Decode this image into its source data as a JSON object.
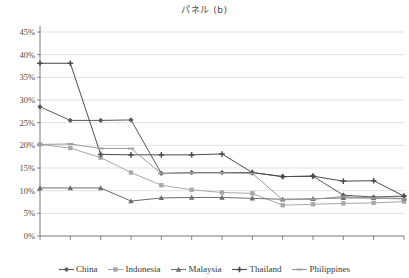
{
  "chart_data": {
    "type": "line",
    "title": "パネル (b)",
    "xlabel": "",
    "ylabel": "",
    "ylim": [
      0,
      45
    ],
    "ytick_labels": [
      "0%",
      "5%",
      "10%",
      "15%",
      "20%",
      "25%",
      "30%",
      "35%",
      "40%",
      "45%"
    ],
    "ytick_values": [
      0,
      5,
      10,
      15,
      20,
      25,
      30,
      35,
      40,
      45
    ],
    "grid": true,
    "grid_axis": "y",
    "legend_position": "bottom",
    "categories": [
      "1993",
      "1994",
      "1995",
      "1996",
      "1997",
      "1998",
      "1999",
      "2000",
      "2001",
      "2002",
      "2003",
      "2004",
      "2005"
    ],
    "series": [
      {
        "name": "China",
        "color": "#595959",
        "marker": "diamond",
        "values": [
          28.5,
          25.5,
          25.5,
          25.6,
          13.8,
          14.0,
          14.0,
          14.0,
          13.1,
          13.2,
          9.0,
          8.6,
          8.8
        ]
      },
      {
        "name": "Indonesia",
        "color": "#a8a8a8",
        "marker": "square",
        "values": [
          20.2,
          19.4,
          17.3,
          14.0,
          11.2,
          10.2,
          9.6,
          9.4,
          6.8,
          7.0,
          7.2,
          7.3,
          7.6
        ]
      },
      {
        "name": "Malaysia",
        "color": "#6e6e6e",
        "marker": "triangle",
        "values": [
          10.6,
          10.6,
          10.6,
          7.7,
          8.4,
          8.5,
          8.5,
          8.3,
          8.1,
          8.2,
          8.4,
          8.4,
          8.3
        ]
      },
      {
        "name": "Thailand",
        "color": "#4a4a4a",
        "marker": "cross",
        "values": [
          38.1,
          38.1,
          18.0,
          17.9,
          17.9,
          17.9,
          18.1,
          14.0,
          13.1,
          13.2,
          12.1,
          12.2,
          8.8
        ]
      },
      {
        "name": "Philippines",
        "color": "#9a9a9a",
        "marker": "dash",
        "values": [
          20.2,
          20.3,
          19.3,
          19.3,
          13.8,
          13.9,
          13.9,
          13.8,
          8.0,
          8.1,
          8.7,
          8.3,
          8.2
        ]
      }
    ]
  },
  "legend": {
    "items": [
      "China",
      "Indonesia",
      "Malaysia",
      "Thailand",
      "Philippines"
    ]
  }
}
